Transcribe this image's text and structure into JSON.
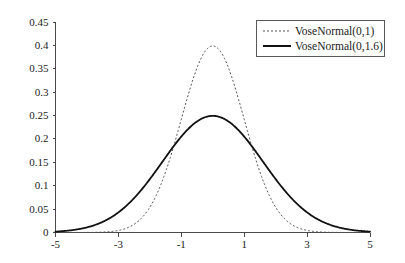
{
  "chart_data": {
    "type": "line",
    "title": "",
    "subtitle": "",
    "xlabel": "",
    "ylabel": "",
    "xlim": [
      -5,
      5
    ],
    "ylim": [
      0,
      0.45
    ],
    "grid": false,
    "legend_position": "top-right",
    "x_ticks": [
      -5,
      -3,
      -1,
      1,
      3,
      5
    ],
    "x_tick_labels": [
      "-5",
      "-3",
      "-1",
      "1",
      "3",
      "5"
    ],
    "y_ticks": [
      0,
      0.05,
      0.1,
      0.15,
      0.2,
      0.25,
      0.3,
      0.35,
      0.4,
      0.45
    ],
    "y_tick_labels": [
      "0",
      "0.05",
      "0.1",
      "0.15",
      "0.2",
      "0.25",
      "0.3",
      "0.35",
      "0.4",
      "0.45"
    ],
    "series": [
      {
        "name": "VoseNormal(0,1)",
        "style": "dashed",
        "color": "#555555",
        "mu": 0,
        "sigma": 1,
        "peak_value": 0.3989,
        "x": [
          -5,
          -4.5,
          -4,
          -3.5,
          -3,
          -2.5,
          -2,
          -1.5,
          -1,
          -0.5,
          0,
          0.5,
          1,
          1.5,
          2,
          2.5,
          3,
          3.5,
          4,
          4.5,
          5
        ],
        "values": [
          1.5e-06,
          1.6e-05,
          0.0001338,
          0.0008727,
          0.0044318,
          0.0175283,
          0.053991,
          0.1295176,
          0.2419707,
          0.3520653,
          0.3989423,
          0.3520653,
          0.2419707,
          0.1295176,
          0.053991,
          0.0175283,
          0.0044318,
          0.0008727,
          0.0001338,
          1.6e-05,
          1.5e-06
        ]
      },
      {
        "name": "VoseNormal(0,1.6)",
        "style": "solid",
        "color": "#111111",
        "mu": 0,
        "sigma": 1.6,
        "peak_value": 0.2494,
        "x": [
          -5,
          -4.5,
          -4,
          -3.5,
          -3,
          -2.5,
          -2,
          -1.5,
          -1,
          -0.5,
          0,
          0.5,
          1,
          1.5,
          2,
          2.5,
          3,
          3.5,
          4,
          4.5,
          5
        ],
        "values": [
          0.0018758,
          0.0048549,
          0.01111,
          0.022493,
          0.040262,
          0.0637133,
          0.0891202,
          0.110153,
          0.1202165,
          0.1161114,
          0.2493766,
          0.2374324,
          0.2055446,
          0.1622043,
          0.1168236,
          0.0768158,
          0.0461069,
          0.0252328,
          0.0126011,
          0.0057376,
          0.00238
        ]
      }
    ]
  },
  "legend": {
    "entries": [
      {
        "label": "VoseNormal(0,1)",
        "style": "dashed"
      },
      {
        "label": "VoseNormal(0,1.6)",
        "style": "solid"
      }
    ]
  },
  "axes": {
    "y_labels": [
      "0.45",
      "0.4",
      "0.35",
      "0.3",
      "0.25",
      "0.2",
      "0.15",
      "0.1",
      "0.05",
      "0"
    ],
    "x_labels": [
      "-5",
      "-3",
      "-1",
      "1",
      "3",
      "5"
    ]
  }
}
